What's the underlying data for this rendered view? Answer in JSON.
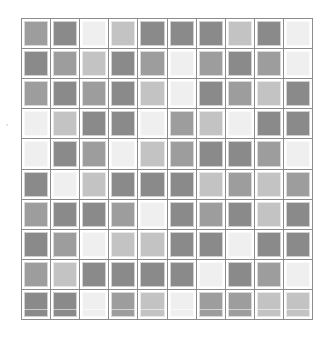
{
  "board": {
    "rows": 10,
    "cols": 10,
    "palette": {
      "dark": "#8a8a8a",
      "mid": "#9d9d9d",
      "light": "#c3c3c3",
      "white": "#efefef"
    },
    "cells": [
      [
        "mid",
        "dark",
        "white",
        "light",
        "dark",
        "dark",
        "dark",
        "light",
        "dark",
        "white"
      ],
      [
        "dark",
        "mid",
        "light",
        "dark",
        "mid",
        "white",
        "mid",
        "dark",
        "mid",
        "white"
      ],
      [
        "mid",
        "dark",
        "mid",
        "dark",
        "light",
        "white",
        "dark",
        "mid",
        "light",
        "dark"
      ],
      [
        "white",
        "light",
        "dark",
        "dark",
        "white",
        "mid",
        "light",
        "white",
        "dark",
        "dark"
      ],
      [
        "white",
        "dark",
        "mid",
        "white",
        "light",
        "mid",
        "dark",
        "dark",
        "mid",
        "white"
      ],
      [
        "dark",
        "white",
        "light",
        "dark",
        "dark",
        "dark",
        "light",
        "mid",
        "light",
        "mid"
      ],
      [
        "mid",
        "dark",
        "dark",
        "mid",
        "white",
        "dark",
        "mid",
        "dark",
        "light",
        "dark"
      ],
      [
        "dark",
        "mid",
        "white",
        "light",
        "light",
        "dark",
        "dark",
        "white",
        "dark",
        "dark"
      ],
      [
        "mid",
        "light",
        "dark",
        "dark",
        "dark",
        "dark",
        "white",
        "dark",
        "mid",
        "white"
      ],
      [
        "dark",
        "dark",
        "white",
        "mid",
        "light",
        "white",
        "mid",
        "mid",
        "light",
        "light"
      ]
    ]
  }
}
